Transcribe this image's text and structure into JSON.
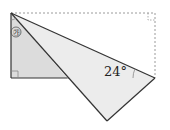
{
  "diagram": {
    "type": "geometry-folded-rectangle",
    "labels": {
      "given_angle": "24°",
      "unknown_angle_marker": "㉮"
    },
    "colors": {
      "solid_line": "#333333",
      "dashed_line": "#999999",
      "left_triangle_fill": "#dcdcdc",
      "folded_triangle_fill": "#ececec",
      "right_angle_mark": "#888888"
    }
  }
}
